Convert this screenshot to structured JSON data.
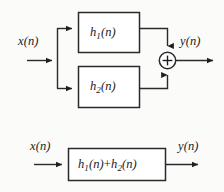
{
  "figure": {
    "type": "block-diagram",
    "background_color": "#fbfbfa",
    "line_color": "#2a2a2a",
    "text_color": "#1a1a1a"
  },
  "top_diagram": {
    "input_label": "x(n)",
    "output_label": "y(n)",
    "block1": {
      "base": "h",
      "sub": "1",
      "arg": "(n)",
      "text": "h1(n)"
    },
    "block2": {
      "base": "h",
      "sub": "2",
      "arg": "(n)",
      "text": "h2(n)"
    },
    "adder": {
      "symbol": "+",
      "shape": "circle"
    },
    "branch_node": "split-point"
  },
  "bottom_diagram": {
    "input_label": "x(n)",
    "output_label": "y(n)",
    "block": {
      "base1": "h",
      "sub1": "1",
      "arg1": "(n)",
      "operator": "+",
      "base2": "h",
      "sub2": "2",
      "arg2": "(n)",
      "text": "h1(n)+h2(n)"
    }
  }
}
